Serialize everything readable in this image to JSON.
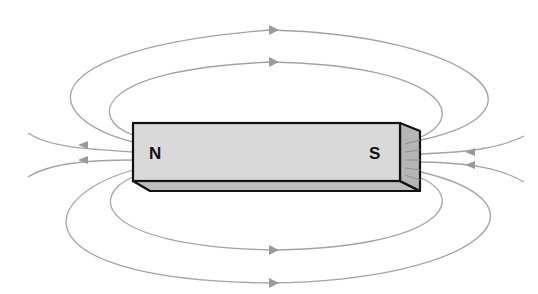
{
  "diagram": {
    "magnet": {
      "north_label": "N",
      "south_label": "S",
      "front_face_color": "#d9d9d9",
      "bottom_face_color": "#bdbdbd",
      "side_face_color": "#b5b5b5",
      "outline_color": "#111111"
    },
    "field_lines": {
      "color": "#a3a3a3",
      "arrow_color": "#9a9a9a",
      "loops": [
        {
          "name": "top-outer",
          "arrow_direction": "right"
        },
        {
          "name": "top-inner",
          "arrow_direction": "right"
        },
        {
          "name": "bottom-inner",
          "arrow_direction": "right"
        },
        {
          "name": "bottom-outer",
          "arrow_direction": "right"
        }
      ],
      "end_lines": [
        {
          "name": "left-upper",
          "arrow_direction": "left"
        },
        {
          "name": "left-lower",
          "arrow_direction": "left"
        },
        {
          "name": "right-upper",
          "arrow_direction": "left"
        },
        {
          "name": "right-lower",
          "arrow_direction": "left"
        }
      ]
    }
  }
}
